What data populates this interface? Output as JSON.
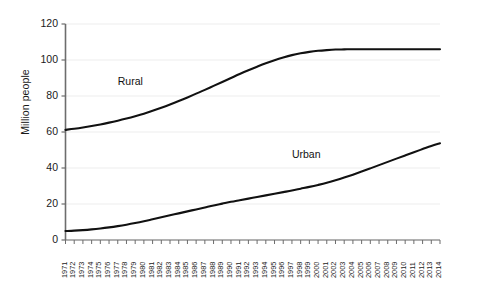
{
  "chart_data": {
    "type": "line",
    "title": "",
    "xlabel": "",
    "ylabel": "Million people",
    "ylim": [
      0,
      120
    ],
    "yticks": [
      0,
      20,
      40,
      60,
      80,
      100,
      120
    ],
    "grid": true,
    "legend_position": "inline-labels",
    "x": [
      1971,
      1972,
      1973,
      1974,
      1975,
      1976,
      1977,
      1978,
      1979,
      1980,
      1981,
      1982,
      1983,
      1984,
      1985,
      1986,
      1987,
      1988,
      1989,
      1990,
      1991,
      1992,
      1993,
      1994,
      1995,
      1996,
      1997,
      1998,
      1999,
      2000,
      2001,
      2002,
      2003,
      2004,
      2005,
      2006,
      2007,
      2008,
      2009,
      2010,
      2011,
      2012,
      2013,
      2014
    ],
    "series": [
      {
        "name": "Rural",
        "color": "#111111",
        "label_x": 1977,
        "label_y": 88,
        "values": [
          61.2,
          61.8,
          62.5,
          63.3,
          64.2,
          65.2,
          66.3,
          67.5,
          68.8,
          70.2,
          71.8,
          73.5,
          75.3,
          77.2,
          79.2,
          81.3,
          83.4,
          85.6,
          87.8,
          90.0,
          92.2,
          94.3,
          96.3,
          98.2,
          99.9,
          101.4,
          102.7,
          103.7,
          104.5,
          105.1,
          105.5,
          105.8,
          105.9,
          106.0,
          106.0,
          106.0,
          106.0,
          106.0,
          106.0,
          106.0,
          106.0,
          106.0,
          106.0,
          106.0
        ]
      },
      {
        "name": "Urban",
        "color": "#111111",
        "label_x": 1997,
        "label_y": 47,
        "values": [
          5.0,
          5.2,
          5.5,
          5.9,
          6.4,
          7.0,
          7.7,
          8.5,
          9.4,
          10.4,
          11.5,
          12.6,
          13.7,
          14.8,
          15.9,
          17.0,
          18.1,
          19.2,
          20.2,
          21.2,
          22.1,
          23.0,
          23.9,
          24.8,
          25.7,
          26.6,
          27.5,
          28.5,
          29.5,
          30.6,
          31.8,
          33.2,
          34.7,
          36.3,
          38.0,
          39.8,
          41.6,
          43.4,
          45.2,
          47.0,
          48.8,
          50.5,
          52.2,
          53.7
        ]
      }
    ]
  },
  "axes": {
    "y_axis_label": "Million people",
    "y_tick_labels": [
      "0",
      "20",
      "40",
      "60",
      "80",
      "100",
      "120"
    ],
    "x_tick_labels": [
      "1971",
      "1972",
      "1973",
      "1974",
      "1975",
      "1976",
      "1977",
      "1978",
      "1979",
      "1980",
      "1981",
      "1982",
      "1983",
      "1984",
      "1985",
      "1986",
      "1987",
      "1988",
      "1989",
      "1990",
      "1991",
      "1992",
      "1993",
      "1994",
      "1995",
      "1996",
      "1997",
      "1998",
      "1999",
      "2000",
      "2001",
      "2002",
      "2003",
      "2004",
      "2005",
      "2006",
      "2007",
      "2008",
      "2009",
      "2010",
      "2011",
      "2012",
      "2013",
      "2014"
    ]
  },
  "colors": {
    "line": "#111111",
    "axis": "#6d6d6d",
    "grid": "#ededed",
    "text": "#1a1a1a",
    "background": "#ffffff"
  }
}
